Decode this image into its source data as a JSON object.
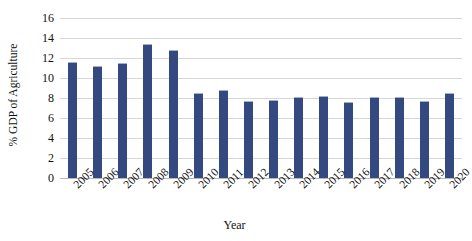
{
  "chart_data": {
    "type": "bar",
    "title": "",
    "xlabel": "Year",
    "ylabel": "% GDP of Agriculture",
    "categories": [
      "2005",
      "2006",
      "2007",
      "2008",
      "2009",
      "2010",
      "2011",
      "2012",
      "2013",
      "2014",
      "2015",
      "2016",
      "2017",
      "2018",
      "2019",
      "2020"
    ],
    "values": [
      11.6,
      11.2,
      11.5,
      13.4,
      12.8,
      8.5,
      8.8,
      7.7,
      7.8,
      8.1,
      8.2,
      7.6,
      8.1,
      8.1,
      7.7,
      8.5
    ],
    "ylim": [
      0,
      16
    ],
    "yticks": [
      0,
      2,
      4,
      6,
      8,
      10,
      12,
      14,
      16
    ],
    "ytick_labels": [
      "0",
      "2",
      "4",
      "6",
      "8",
      "10",
      "12",
      "14",
      "16"
    ],
    "grid": true,
    "legend": "none",
    "series_color": "#33497f",
    "gridline_color": "#d6d6d6"
  }
}
